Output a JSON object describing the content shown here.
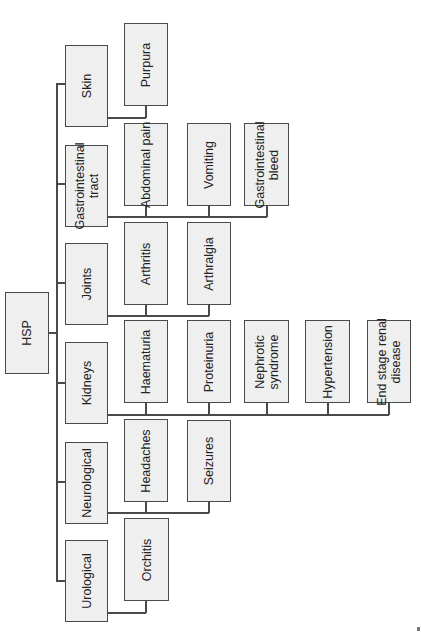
{
  "diagram": {
    "title": "HSP",
    "orientation": "rotated-90-counterclockwise",
    "root": {
      "label": "HSP",
      "children": [
        {
          "label": "Skin",
          "children": [
            "Purpura"
          ]
        },
        {
          "label": "Gastrointestinal tract",
          "children": [
            "Abdominal pain",
            "Vomiting",
            "Gastrointestinal bleed"
          ]
        },
        {
          "label": "Joints",
          "children": [
            "Arthritis",
            "Arthralgia"
          ]
        },
        {
          "label": "Kidneys",
          "children": [
            "Haematuria",
            "Proteinuria",
            "Nephrotic syndrome",
            "Hypertension",
            "End stage renal disease"
          ]
        },
        {
          "label": "Neurological",
          "children": [
            "Headaches",
            "Seizures"
          ]
        },
        {
          "label": "Urological",
          "children": [
            "Orchitis"
          ]
        }
      ]
    },
    "nodes": {
      "hsp": "HSP",
      "skin": "Skin",
      "gi_line1": "Gastrointestinal",
      "gi_line2": "tract",
      "joints": "Joints",
      "kidneys": "Kidneys",
      "neuro": "Neurological",
      "uro": "Urological",
      "purpura": "Purpura",
      "abdominal_pain": "Abdominal pain",
      "vomiting": "Vomiting",
      "gi_bleed_line1": "Gastrointestinal",
      "gi_bleed_line2": "bleed",
      "arthritis": "Arthritis",
      "arthralgia": "Arthralgia",
      "haematuria": "Haematuria",
      "proteinuria": "Proteinuria",
      "nephrotic_line1": "Nephrotic",
      "nephrotic_line2": "syndrome",
      "hypertension": "Hypertension",
      "esrd_line1": "End stage renal",
      "esrd_line2": "disease",
      "headaches": "Headaches",
      "seizures": "Seizures",
      "orchitis": "Orchitis"
    },
    "colors": {
      "box_fill": "#efefef",
      "box_border": "#4a4a4a",
      "connector": "#4a4a4a",
      "text": "#222222"
    }
  }
}
